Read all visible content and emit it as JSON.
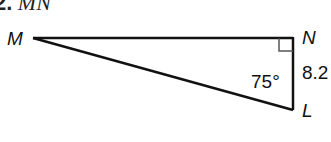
{
  "problem": {
    "number": "2.",
    "prompt": "MN"
  },
  "triangle": {
    "vertices": {
      "M": {
        "label": "M"
      },
      "N": {
        "label": "N"
      },
      "L": {
        "label": "L"
      }
    },
    "right_angle_at": "N",
    "angle_label": "75°",
    "side_label": "8.2",
    "colors": {
      "stroke": "#111111",
      "right_angle_mark": "#555555"
    }
  }
}
